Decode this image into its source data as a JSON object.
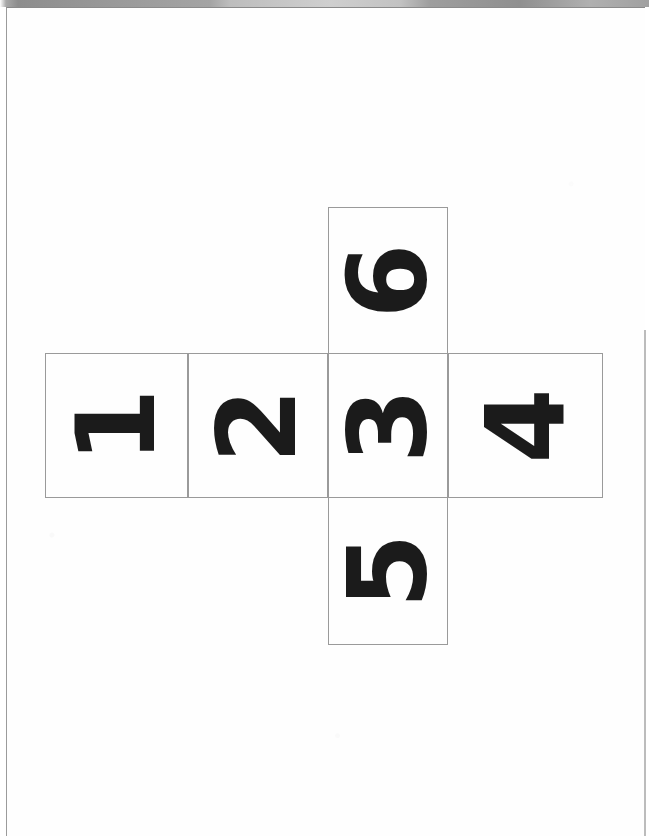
{
  "document": {
    "kind": "scanned-worksheet",
    "title": "Cube net with numbered faces",
    "orientation_note": "digits printed rotated 90 degrees counter-clockwise",
    "page_background": "#ffffff",
    "ink_color": "#1b1b1b",
    "rule_color": "#9a9a9a",
    "scan_band_color": "#8d8d8d"
  },
  "net": {
    "shape": "cross",
    "face_count": 6,
    "cells": [
      {
        "id": "top",
        "label": "6",
        "row": "top",
        "column": "center"
      },
      {
        "id": "left1",
        "label": "1",
        "row": "middle",
        "column": "far-left"
      },
      {
        "id": "left2",
        "label": "2",
        "row": "middle",
        "column": "left"
      },
      {
        "id": "mid",
        "label": "3",
        "row": "middle",
        "column": "center"
      },
      {
        "id": "right",
        "label": "4",
        "row": "middle",
        "column": "right"
      },
      {
        "id": "bottom",
        "label": "5",
        "row": "bottom",
        "column": "center"
      }
    ]
  }
}
